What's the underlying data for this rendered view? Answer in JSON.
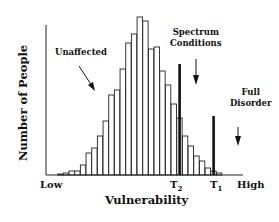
{
  "chart_data": {
    "type": "bar",
    "title": "",
    "xlabel": "Vulnerability",
    "ylabel": "Number of People",
    "x_tick_labels": [
      "Low",
      "T2",
      "T1",
      "High"
    ],
    "grid": false,
    "legend": null,
    "categories": [
      "1",
      "2",
      "3",
      "4",
      "5",
      "6",
      "7",
      "8",
      "9",
      "10",
      "11",
      "12",
      "13",
      "14",
      "15",
      "16",
      "17",
      "18",
      "19",
      "20",
      "21",
      "22",
      "23",
      "24",
      "25",
      "26",
      "27",
      "28",
      "29"
    ],
    "values": [
      1,
      2,
      4,
      4,
      10,
      22,
      27,
      39,
      54,
      80,
      85,
      106,
      132,
      141,
      158,
      154,
      126,
      128,
      104,
      90,
      71,
      57,
      39,
      29,
      19,
      14,
      7,
      4,
      2
    ],
    "thresholds": [
      {
        "name": "T2",
        "bar_index": 21.5,
        "height": 111
      },
      {
        "name": "T1",
        "bar_index": 27.5,
        "height": 59
      }
    ],
    "annotations": [
      {
        "text": "Unaffected",
        "arrow": "down-right"
      },
      {
        "text": "Spectrum Conditions",
        "arrow": "down"
      },
      {
        "text": "Full Disorder",
        "arrow": "down"
      }
    ],
    "ylim": [
      0,
      160
    ]
  },
  "labels": {
    "unaffected": "Unaffected",
    "spectrum_line1": "Spectrum",
    "spectrum_line2": "Conditions",
    "full_line1": "Full",
    "full_line2": "Disorder",
    "low": "Low",
    "high": "High",
    "t2_main": "T",
    "t2_sub": "2",
    "t1_main": "T",
    "t1_sub": "1",
    "xlabel": "Vulnerability",
    "ylabel": "Number of People"
  }
}
